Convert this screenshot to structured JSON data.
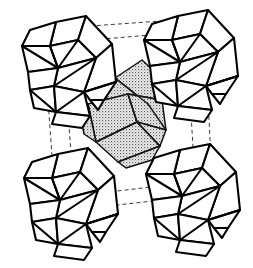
{
  "figure": {
    "background_color": "#ffffff",
    "canvas": {
      "width": 253,
      "height": 268
    }
  },
  "style": {
    "edge_color": "#000000",
    "edge_width": 2.1,
    "cell_line_color": "#3a3a3a",
    "cell_dash": "4 3",
    "face_fill_corner": "#ffffff",
    "face_fill_center": "#b0b0b0",
    "stipple_dot_color": "#4d4d4d"
  },
  "unit_cell": {
    "name": "unit-cell-box",
    "line_style": "dashed",
    "front_face": [
      [
        44,
        44
      ],
      [
        186,
        32
      ],
      [
        196,
        196
      ],
      [
        56,
        212
      ]
    ],
    "back_face": [
      [
        62,
        28
      ],
      [
        204,
        18
      ],
      [
        212,
        180
      ],
      [
        74,
        196
      ]
    ],
    "connectors": [
      [
        [
          44,
          44
        ],
        [
          62,
          28
        ]
      ],
      [
        [
          186,
          32
        ],
        [
          204,
          18
        ]
      ],
      [
        [
          196,
          196
        ],
        [
          212,
          180
        ]
      ],
      [
        [
          56,
          212
        ],
        [
          74,
          196
        ]
      ]
    ]
  },
  "clusters": [
    {
      "id": "cluster-top-left",
      "label": "Top-left corner polyhedral cluster",
      "shading": "white",
      "origin": [
        18,
        16
      ]
    },
    {
      "id": "cluster-top-right",
      "label": "Top-right corner polyhedral cluster",
      "shading": "white",
      "origin": [
        140,
        10
      ]
    },
    {
      "id": "cluster-bottom-left",
      "label": "Bottom-left corner polyhedral cluster",
      "shading": "white",
      "origin": [
        18,
        148
      ]
    },
    {
      "id": "cluster-bottom-right",
      "label": "Bottom-right corner polyhedral cluster",
      "shading": "white",
      "origin": [
        140,
        144
      ]
    },
    {
      "id": "cluster-body-center",
      "label": "Body-centre shaded polyhedral cluster",
      "shading": "stippled-gray",
      "origin": [
        82,
        58
      ]
    }
  ],
  "counts": {
    "corner_clusters": 4,
    "centre_clusters": 1,
    "total_clusters": 5
  },
  "annotations": {
    "has_text_labels": false,
    "has_axis_labels": false,
    "has_legend": false
  }
}
